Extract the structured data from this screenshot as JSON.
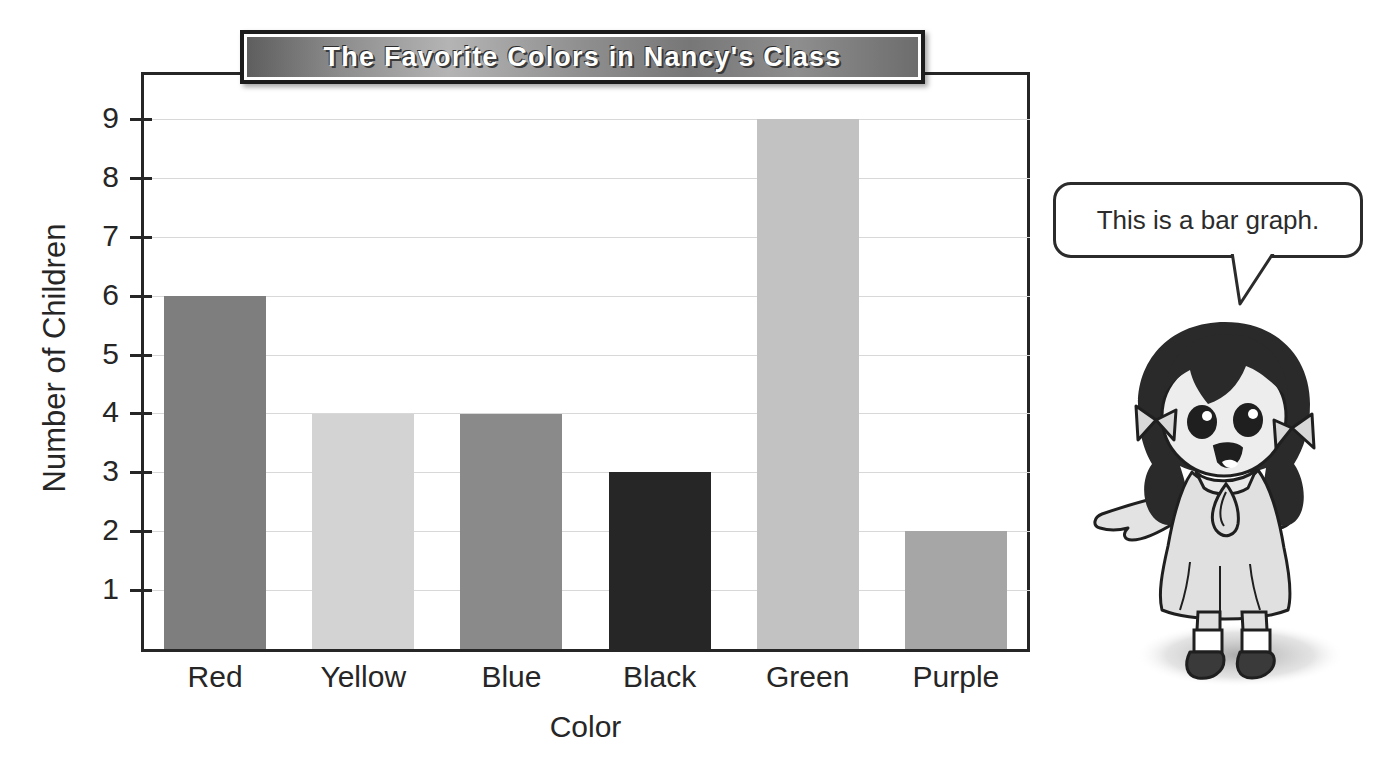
{
  "page": {
    "top_artifact_text": "",
    "background_color": "#ffffff"
  },
  "banner": {
    "title": "The Favorite Colors in Nancy's Class",
    "text_color": "#ffffff",
    "border_color": "#1c1c1c"
  },
  "speech_bubble": {
    "text": "This is a bar graph.",
    "border_color": "#2b2b2b",
    "fill_color": "#ffffff"
  },
  "character": {
    "name": "nancy-girl-illustration",
    "hair_color": "#2a2a2a",
    "dress_color": "#d6d6d6",
    "skin_color": "#e8e8e8",
    "shoe_color": "#3a3a3a"
  },
  "chart_data": {
    "type": "bar",
    "title": "The Favorite Colors in Nancy's Class",
    "xlabel": "Color",
    "ylabel": "Number of Children",
    "categories": [
      "Red",
      "Yellow",
      "Blue",
      "Black",
      "Green",
      "Purple"
    ],
    "values": [
      6,
      4,
      4,
      3,
      9,
      2
    ],
    "bar_colors": [
      "#7e7e7e",
      "#d3d3d3",
      "#8a8a8a",
      "#262626",
      "#c2c2c2",
      "#a6a6a6"
    ],
    "ylim": [
      0,
      9.8
    ],
    "yticks": [
      1,
      2,
      3,
      4,
      5,
      6,
      7,
      8,
      9
    ],
    "ytick_labels": [
      "1",
      "2",
      "3",
      "4",
      "5",
      "6",
      "7",
      "8",
      "9"
    ],
    "grid": true,
    "legend": false,
    "axis_color": "#262626",
    "gridline_color": "#d8d8d8"
  }
}
